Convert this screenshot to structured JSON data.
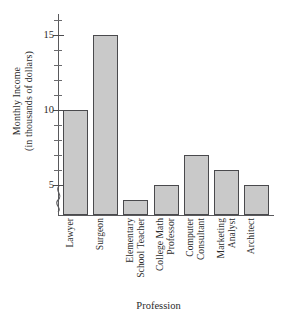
{
  "chart_data": {
    "type": "bar",
    "title": "",
    "xlabel": "Profession",
    "ylabel": "Monthly Income (in thousands of dollars)",
    "ylabel_lines": [
      "Monthly Income",
      "(in thousands of dollars)"
    ],
    "categories": [
      "Lawyer",
      "Surgeon",
      "Elementary School Teacher",
      "College Math Professor",
      "Computer Consultant",
      "Marketing Analyst",
      "Architect"
    ],
    "category_lines": [
      [
        "Lawyer"
      ],
      [
        "Surgeon"
      ],
      [
        "Elementary",
        "School Teacher"
      ],
      [
        "College Math",
        "Professor"
      ],
      [
        "Computer",
        "Consultant"
      ],
      [
        "Marketing",
        "Analyst"
      ],
      [
        "Architect"
      ]
    ],
    "values": [
      10,
      15,
      4,
      5,
      7,
      6,
      5
    ],
    "ylim": [
      3,
      16
    ],
    "ytick_major": [
      5,
      10,
      15
    ],
    "ytick_major_labels": [
      "5",
      "10",
      "15"
    ],
    "ytick_minor": [
      6,
      7,
      8,
      9,
      11,
      12,
      13,
      14,
      16
    ],
    "grid": false,
    "legend": "none",
    "axis_break": true,
    "axis_break_note": "y-axis break below 5",
    "bar_fill_color": "#c9c9c9",
    "bar_border_color": "#4a4a4d",
    "axis_color": "#59595c",
    "background_color": "#ffffff"
  }
}
